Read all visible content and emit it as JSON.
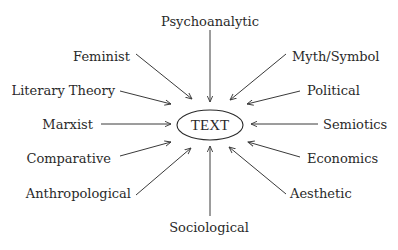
{
  "diagram": {
    "center": {
      "label": "TEXT"
    },
    "nodes": [
      {
        "id": "psychoanalytic",
        "label": "Psychoanalytic"
      },
      {
        "id": "feminist",
        "label": "Feminist"
      },
      {
        "id": "myth-symbol",
        "label": "Myth/Symbol"
      },
      {
        "id": "literary-theory",
        "label": "Literary Theory"
      },
      {
        "id": "political",
        "label": "Political"
      },
      {
        "id": "marxist",
        "label": "Marxist"
      },
      {
        "id": "semiotics",
        "label": "Semiotics"
      },
      {
        "id": "comparative",
        "label": "Comparative"
      },
      {
        "id": "economics",
        "label": "Economics"
      },
      {
        "id": "anthropological",
        "label": "Anthropological"
      },
      {
        "id": "aesthetic",
        "label": "Aesthetic"
      },
      {
        "id": "sociological",
        "label": "Sociological"
      }
    ],
    "edges": [
      {
        "from": "psychoanalytic",
        "to": "TEXT"
      },
      {
        "from": "feminist",
        "to": "TEXT"
      },
      {
        "from": "myth-symbol",
        "to": "TEXT"
      },
      {
        "from": "literary-theory",
        "to": "TEXT"
      },
      {
        "from": "political",
        "to": "TEXT"
      },
      {
        "from": "marxist",
        "to": "TEXT"
      },
      {
        "from": "semiotics",
        "to": "TEXT"
      },
      {
        "from": "comparative",
        "to": "TEXT"
      },
      {
        "from": "economics",
        "to": "TEXT"
      },
      {
        "from": "anthropological",
        "to": "TEXT"
      },
      {
        "from": "aesthetic",
        "to": "TEXT"
      },
      {
        "from": "sociological",
        "to": "TEXT"
      }
    ],
    "colors": {
      "ink": "#2a2a2a",
      "background": "#ffffff"
    }
  }
}
